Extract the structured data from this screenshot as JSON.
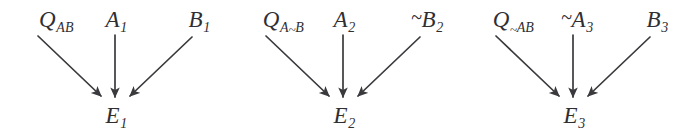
{
  "figure": {
    "background_color": "#ffffff",
    "stroke_color": "#3a3a3e",
    "text_color": "#2f2f33"
  },
  "groups": [
    {
      "id": "group-1",
      "center_x": 115,
      "parents": [
        {
          "id": "q1",
          "base": "Q",
          "subscript": "AB",
          "negate_base": false,
          "negate_sub_prefix": false,
          "x": 56,
          "y": 8
        },
        {
          "id": "a1",
          "base": "A",
          "subscript": "1",
          "negate_base": false,
          "negate_sub_prefix": false,
          "x": 116,
          "y": 8
        },
        {
          "id": "b1",
          "base": "B",
          "subscript": "1",
          "negate_base": false,
          "negate_sub_prefix": false,
          "x": 199,
          "y": 8
        }
      ],
      "effect": {
        "id": "e1",
        "base": "E",
        "subscript": "1",
        "x": 116,
        "y": 104
      },
      "edges": [
        {
          "from": "q1",
          "to": "e1",
          "x1": 38,
          "y1": 36,
          "x2": 101,
          "y2": 96
        },
        {
          "from": "a1",
          "to": "e1",
          "x1": 115,
          "y1": 35,
          "x2": 115,
          "y2": 97
        },
        {
          "from": "b1",
          "to": "e1",
          "x1": 192,
          "y1": 37,
          "x2": 130,
          "y2": 96
        }
      ]
    },
    {
      "id": "group-2",
      "center_x": 343,
      "parents": [
        {
          "id": "q2",
          "base": "Q",
          "subscript": "A~B",
          "negate_base": false,
          "negate_sub_prefix": false,
          "x": 283,
          "y": 8
        },
        {
          "id": "a2",
          "base": "A",
          "subscript": "2",
          "negate_base": false,
          "negate_sub_prefix": false,
          "x": 344,
          "y": 8
        },
        {
          "id": "b2",
          "base": "B",
          "subscript": "2",
          "negate_base": true,
          "negate_sub_prefix": false,
          "x": 427,
          "y": 8
        }
      ],
      "effect": {
        "id": "e2",
        "base": "E",
        "subscript": "2",
        "x": 344,
        "y": 104
      },
      "edges": [
        {
          "from": "q2",
          "to": "e2",
          "x1": 266,
          "y1": 36,
          "x2": 329,
          "y2": 96
        },
        {
          "from": "a2",
          "to": "e2",
          "x1": 343,
          "y1": 35,
          "x2": 343,
          "y2": 97
        },
        {
          "from": "b2",
          "to": "e2",
          "x1": 420,
          "y1": 37,
          "x2": 358,
          "y2": 96
        }
      ]
    },
    {
      "id": "group-3",
      "center_x": 573,
      "parents": [
        {
          "id": "q3",
          "base": "Q",
          "subscript": "~AB",
          "negate_base": false,
          "negate_sub_prefix": false,
          "x": 513,
          "y": 8
        },
        {
          "id": "a3",
          "base": "A",
          "subscript": "3",
          "negate_base": true,
          "negate_sub_prefix": false,
          "x": 577,
          "y": 8
        },
        {
          "id": "b3",
          "base": "B",
          "subscript": "3",
          "negate_base": false,
          "negate_sub_prefix": false,
          "x": 657,
          "y": 8
        }
      ],
      "effect": {
        "id": "e3",
        "base": "E",
        "subscript": "3",
        "x": 574,
        "y": 104
      },
      "edges": [
        {
          "from": "q3",
          "to": "e3",
          "x1": 496,
          "y1": 36,
          "x2": 559,
          "y2": 96
        },
        {
          "from": "a3",
          "to": "e3",
          "x1": 573,
          "y1": 35,
          "x2": 573,
          "y2": 97
        },
        {
          "from": "b3",
          "to": "e3",
          "x1": 650,
          "y1": 37,
          "x2": 588,
          "y2": 96
        }
      ]
    }
  ]
}
